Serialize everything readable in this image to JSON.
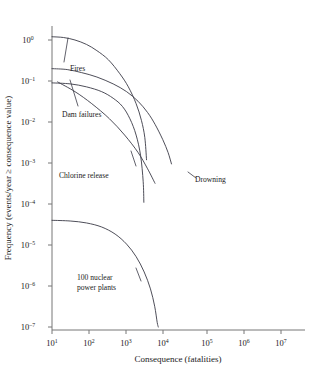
{
  "chart_data": {
    "type": "line",
    "title": "",
    "xlabel": "Consequence (fatalities)",
    "ylabel": "Frequency (events/year ≥ consequence value)",
    "xscale": "log",
    "yscale": "log",
    "xlim": [
      10,
      10000000
    ],
    "ylim": [
      1e-07,
      1
    ],
    "grid": false,
    "legend_position": "inline-annotations",
    "xticks": [
      {
        "value": 10,
        "mantissa": "10",
        "exponent": "1"
      },
      {
        "value": 100,
        "mantissa": "10",
        "exponent": "2"
      },
      {
        "value": 1000,
        "mantissa": "10",
        "exponent": "3"
      },
      {
        "value": 10000,
        "mantissa": "10",
        "exponent": "4"
      },
      {
        "value": 100000,
        "mantissa": "10",
        "exponent": "5"
      },
      {
        "value": 1000000,
        "mantissa": "10",
        "exponent": "6"
      },
      {
        "value": 10000000,
        "mantissa": "10",
        "exponent": "7"
      }
    ],
    "yticks": [
      {
        "value": 1,
        "mantissa": "10",
        "exponent": "0"
      },
      {
        "value": 0.1,
        "mantissa": "10",
        "exponent": "–1"
      },
      {
        "value": 0.01,
        "mantissa": "10",
        "exponent": "–2"
      },
      {
        "value": 0.001,
        "mantissa": "10",
        "exponent": "–3"
      },
      {
        "value": 0.0001,
        "mantissa": "10",
        "exponent": "–4"
      },
      {
        "value": 1e-05,
        "mantissa": "10",
        "exponent": "–5"
      },
      {
        "value": 1e-06,
        "mantissa": "10",
        "exponent": "–6"
      },
      {
        "value": 1e-07,
        "mantissa": "10",
        "exponent": "–7"
      }
    ],
    "series": [
      {
        "name": "Fires",
        "label": "Fires",
        "points": [
          [
            10,
            1.2
          ],
          [
            20,
            1.15
          ],
          [
            40,
            1.0
          ],
          [
            80,
            0.78
          ],
          [
            150,
            0.55
          ],
          [
            300,
            0.33
          ],
          [
            600,
            0.15
          ],
          [
            1000,
            0.072
          ],
          [
            1600,
            0.028
          ],
          [
            2200,
            0.011
          ],
          [
            2700,
            0.0042
          ],
          [
            3000,
            0.0012
          ]
        ]
      },
      {
        "name": "Drowning",
        "label": "Drowning",
        "points": [
          [
            10,
            0.2
          ],
          [
            25,
            0.19
          ],
          [
            60,
            0.16
          ],
          [
            150,
            0.125
          ],
          [
            400,
            0.085
          ],
          [
            900,
            0.055
          ],
          [
            1800,
            0.032
          ],
          [
            3200,
            0.017
          ],
          [
            5000,
            0.0088
          ],
          [
            8000,
            0.0037
          ],
          [
            11000,
            0.0018
          ],
          [
            13500,
            0.00095
          ]
        ]
      },
      {
        "name": "Dam failures",
        "label": "Dam failures",
        "points": [
          [
            10,
            0.09
          ],
          [
            30,
            0.085
          ],
          [
            80,
            0.072
          ],
          [
            200,
            0.055
          ],
          [
            400,
            0.038
          ],
          [
            700,
            0.024
          ],
          [
            1100,
            0.012
          ],
          [
            1600,
            0.0048
          ],
          [
            2100,
            0.0015
          ],
          [
            2450,
            0.00035
          ],
          [
            2550,
            0.00011
          ]
        ]
      },
      {
        "name": "Chlorine release",
        "label": "Chlorine release",
        "points": [
          [
            14,
            0.095
          ],
          [
            40,
            0.055
          ],
          [
            110,
            0.028
          ],
          [
            320,
            0.012
          ],
          [
            800,
            0.0048
          ],
          [
            1800,
            0.0018
          ],
          [
            3200,
            0.00072
          ],
          [
            5000,
            0.00032
          ]
        ]
      },
      {
        "name": "100 nuclear power plants",
        "label": "100 nuclear\npower plants",
        "label_line1": "100 nuclear",
        "label_line2": "power plants",
        "points": [
          [
            10,
            4e-05
          ],
          [
            30,
            3.85e-05
          ],
          [
            80,
            3.45e-05
          ],
          [
            200,
            2.75e-05
          ],
          [
            450,
            1.85e-05
          ],
          [
            900,
            1.05e-05
          ],
          [
            1600,
            5.2e-06
          ],
          [
            2600,
            2.2e-06
          ],
          [
            3800,
            8.5e-07
          ],
          [
            4900,
            3.2e-07
          ],
          [
            5700,
            1.3e-07
          ],
          [
            6100,
            1e-07
          ]
        ]
      }
    ]
  },
  "annotations": {
    "fires": "Fires",
    "drowning": "Drowning",
    "dam_failures": "Dam failures",
    "chlorine_release": "Chlorine release",
    "nuclear_line1": "100 nuclear",
    "nuclear_line2": "power plants"
  },
  "axes": {
    "x_title": "Consequence (fatalities)",
    "y_title": "Frequency (events/year ≥ consequence value)"
  }
}
